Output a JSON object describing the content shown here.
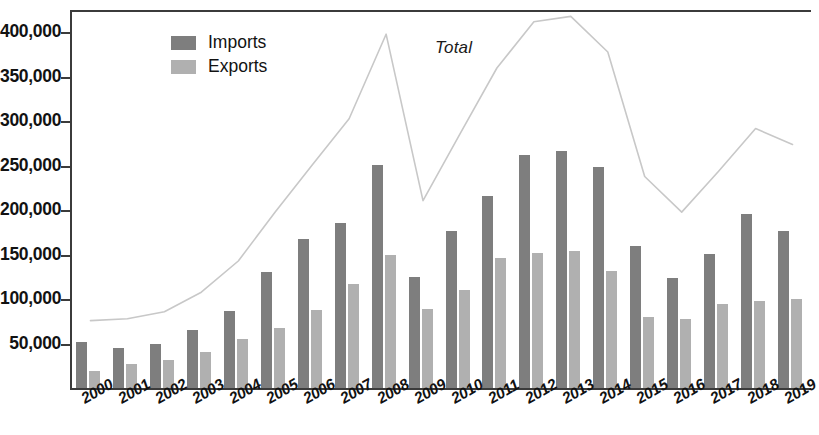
{
  "chart_data": {
    "type": "bar",
    "title": "",
    "xlabel": "",
    "ylabel": "",
    "ylim": [
      0,
      425000
    ],
    "grid": false,
    "legend_position": "top-left",
    "annotations": [
      {
        "text": "Total",
        "refers_to": "total-line"
      }
    ],
    "categories": [
      "2000",
      "2001",
      "2002",
      "2003",
      "2004",
      "2005",
      "2006",
      "2007",
      "2008",
      "2009",
      "2010",
      "2011",
      "2012",
      "2013",
      "2014",
      "2015",
      "2016",
      "2017",
      "2018",
      "2019"
    ],
    "ytick_labels": [
      "400,000",
      "350,000",
      "300,000",
      "250,000",
      "200,000",
      "150,000",
      "100,000",
      "50,000"
    ],
    "ytick_values": [
      400000,
      350000,
      300000,
      250000,
      200000,
      150000,
      100000,
      50000
    ],
    "series": [
      {
        "name": "Imports",
        "kind": "bar",
        "color": "#7e7e7e",
        "values": [
          52000,
          45000,
          50000,
          65000,
          87000,
          131000,
          167000,
          186000,
          251000,
          125000,
          176000,
          216000,
          262000,
          266000,
          248000,
          160000,
          124000,
          151000,
          196000,
          176000
        ]
      },
      {
        "name": "Exports",
        "kind": "bar",
        "color": "#b0b0b0",
        "values": [
          19000,
          27000,
          32000,
          41000,
          55000,
          68000,
          88000,
          117000,
          149000,
          89000,
          110000,
          146000,
          152000,
          154000,
          132000,
          80000,
          78000,
          95000,
          98000,
          100000
        ]
      },
      {
        "name": "Total",
        "kind": "line",
        "color": "#c8c8c8",
        "values": [
          78000,
          80000,
          88000,
          110000,
          145000,
          200000,
          253000,
          305000,
          400000,
          213000,
          288000,
          362000,
          414000,
          420000,
          380000,
          240000,
          200000,
          246000,
          294000,
          276000
        ]
      }
    ]
  },
  "legend": {
    "items": [
      {
        "label": "Imports",
        "color": "#7e7e7e"
      },
      {
        "label": "Exports",
        "color": "#b0b0b0"
      }
    ]
  },
  "annotation": {
    "total_label": "Total"
  }
}
